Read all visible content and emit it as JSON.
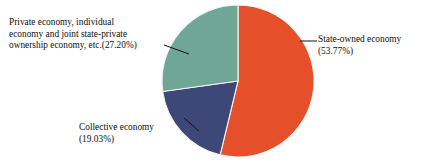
{
  "chart_data": {
    "type": "pie",
    "title": "",
    "subtitle": "",
    "xlabel": "",
    "ylabel": "",
    "grid": false,
    "legend_position": "none",
    "label_style": "outside-with-leader-lines",
    "start_angle_deg": 0,
    "direction": "clockwise",
    "categories": [
      "State-owned economy",
      "Collective economy",
      "Private economy, individual economy and joint state-private ownership economy, etc."
    ],
    "values": [
      53.77,
      19.03,
      27.2
    ],
    "value_unit": "%",
    "colors": [
      "#e5502a",
      "#3e4878",
      "#6fa695"
    ],
    "slices": [
      {
        "name": "State-owned economy",
        "value": 53.77,
        "percent_text": "(53.77%)",
        "color": "#e5502a",
        "label_text": "State-owned economy\n(53.77%)",
        "start_angle_deg": 0,
        "sweep_angle_deg": 193.57
      },
      {
        "name": "Collective economy",
        "value": 19.03,
        "percent_text": "(19.03%)",
        "color": "#3e4878",
        "label_text": "Collective economy\n(19.03%)",
        "start_angle_deg": 193.57,
        "sweep_angle_deg": 68.51
      },
      {
        "name": "Private economy, individual economy and joint state-private ownership economy, etc.",
        "value": 27.2,
        "percent_text": "(27.20%)",
        "color": "#6fa695",
        "label_text": "Private economy, individual\neconomy and joint state-private\nownership economy, etc.(27.20%)",
        "start_angle_deg": 262.08,
        "sweep_angle_deg": 97.92
      }
    ]
  },
  "labels": {
    "private": "Private economy, individual\neconomy and joint state-private\nownership economy, etc.(27.20%)",
    "state_owned": "State-owned economy\n(53.77%)",
    "collective": "Collective economy\n(19.03%)"
  },
  "colors": {
    "state_owned": "#e5502a",
    "collective": "#3e4878",
    "private": "#6fa695",
    "leader_line": "#101010",
    "slice_border": "#f4f4f4",
    "background": "#ffffff",
    "text": "#0d0d0d"
  }
}
